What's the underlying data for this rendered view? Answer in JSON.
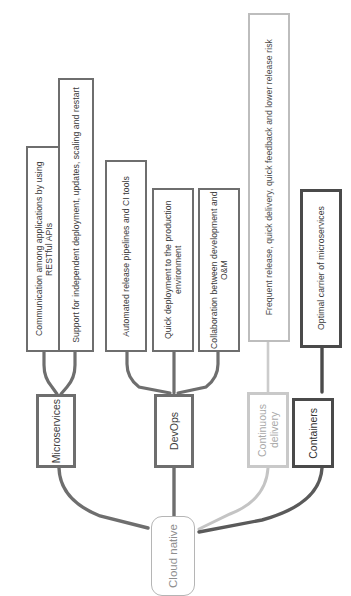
{
  "diagram": {
    "title": "Cloud native",
    "root": {
      "label": "Cloud native",
      "color": "#b5b5b5"
    },
    "pillars": [
      {
        "id": "microservices",
        "label": "Microservices",
        "color": "#6e6e6e",
        "style": "normal"
      },
      {
        "id": "devops",
        "label": "DevOps",
        "color": "#6e6e6e",
        "style": "normal"
      },
      {
        "id": "continuous-delivery",
        "label": "Continuous delivery",
        "color": "#c9c9c9",
        "style": "light"
      },
      {
        "id": "containers",
        "label": "Containers",
        "color": "#4a4a4a",
        "style": "dark"
      }
    ],
    "attributes": [
      {
        "id": "attr-1",
        "parent": "microservices",
        "label": "Communication among applications by using RESTful APIs"
      },
      {
        "id": "attr-2",
        "parent": "microservices",
        "label": "Support for independent deployment, updates, scaling and restart"
      },
      {
        "id": "attr-3",
        "parent": "devops",
        "label": "Automated release pipelines and CI tools"
      },
      {
        "id": "attr-4",
        "parent": "devops",
        "label": "Quick deployment to the production environment"
      },
      {
        "id": "attr-5",
        "parent": "devops",
        "label": "Collaboration between development and O&M"
      },
      {
        "id": "attr-6",
        "parent": "continuous-delivery",
        "label": "Frequent release, quick delivery, quick feedback and lower release risk"
      },
      {
        "id": "attr-7",
        "parent": "containers",
        "label": "Optimal carrier of microservices"
      }
    ]
  }
}
